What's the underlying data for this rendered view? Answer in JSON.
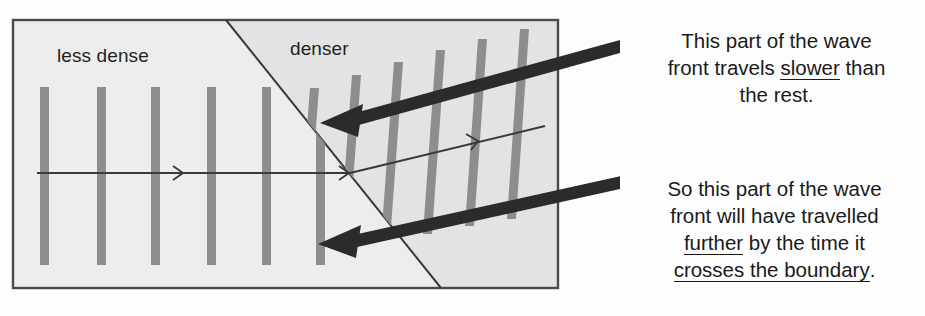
{
  "diagram": {
    "title_labels": {
      "less_dense": "less dense",
      "denser": "denser"
    },
    "colors": {
      "panel_fill": "#e9e9e9",
      "panel_fill_left": "#eeeeee",
      "panel_border": "#4a4a4a",
      "wavefront_bar": "#8a8a8a",
      "ray_line": "#3a3a3a",
      "pointer_arrow": "#2b2b2b",
      "boundary_line": "#3a3a3a",
      "text": "#231f20",
      "background": "#fdfdfd"
    },
    "panel": {
      "x": 13,
      "y": 20,
      "width": 545,
      "height": 268
    },
    "boundary": {
      "x1": 226,
      "y1": 20,
      "x2": 441,
      "y2": 288
    },
    "incident_wavefronts_x": [
      44,
      101,
      155,
      211,
      266,
      320
    ],
    "incident_wavefront": {
      "top": 87,
      "bottom": 265,
      "width": 9
    },
    "refracted_wavefronts": [
      {
        "bx": 300,
        "ty": 88,
        "by": 255
      },
      {
        "bx": 341,
        "ty": 74,
        "by": 248
      },
      {
        "bx": 382,
        "ty": 62,
        "by": 240
      },
      {
        "bx": 424,
        "ty": 50,
        "by": 233
      },
      {
        "bx": 466,
        "ty": 39,
        "by": 225
      },
      {
        "bx": 508,
        "ty": 30,
        "by": 218
      }
    ],
    "refracted_wavefront": {
      "width": 9,
      "tilt_dx": 14
    },
    "incident_ray": {
      "x1": 37,
      "y1": 173,
      "x2": 350,
      "y2": 173
    },
    "refracted_ray": {
      "x1": 350,
      "y1": 173,
      "x2": 545,
      "y2": 126
    },
    "pointer_arrows": [
      {
        "x1": 645,
        "y1": 36,
        "x2": 320,
        "y2": 123
      },
      {
        "x1": 620,
        "y1": 180,
        "x2": 320,
        "y2": 243
      }
    ]
  },
  "annotations": {
    "first": {
      "line1": "This part of the wave",
      "line2_pre": "front travels ",
      "line2_underlined": "slower",
      "line2_post": " than",
      "line3": "the rest."
    },
    "second": {
      "line1": "So this part of the wave",
      "line2": "front will have travelled",
      "line3_underlined": "further",
      "line3_post": " by the time it",
      "line4_underlined": "crosses the boundary",
      "line4_post": "."
    }
  }
}
